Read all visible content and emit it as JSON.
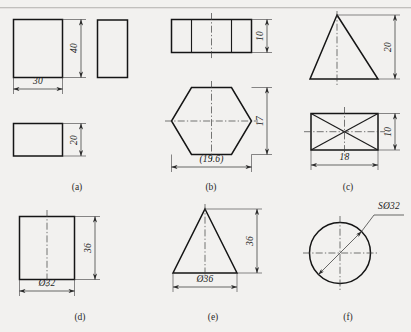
{
  "sheet": {
    "background_color": "#f2f1ef",
    "ink_color": "#151515",
    "panel_labels": [
      "(a)",
      "(b)",
      "(c)",
      "(d)",
      "(e)",
      "(f)"
    ]
  },
  "panels": {
    "a": {
      "label": "(a)",
      "shape": "rectangular-prism-three-view",
      "dims": {
        "height": "40",
        "width": "30",
        "depth": "20"
      }
    },
    "b": {
      "label": "(b)",
      "shape": "hexagonal-prism",
      "dims": {
        "height": "10",
        "across_flats": "17",
        "across_corners": "(19.6)"
      }
    },
    "c": {
      "label": "(c)",
      "shape": "rectangular-pyramid",
      "dims": {
        "height": "20",
        "depth": "10",
        "width": "18"
      }
    },
    "d": {
      "label": "(d)",
      "shape": "cylinder",
      "dims": {
        "height": "36",
        "diameter": "Ø32"
      }
    },
    "e": {
      "label": "(e)",
      "shape": "cone",
      "dims": {
        "height": "36",
        "diameter": "Ø36"
      }
    },
    "f": {
      "label": "(f)",
      "shape": "sphere",
      "dims": {
        "sphere_diameter": "SØ32"
      }
    }
  }
}
